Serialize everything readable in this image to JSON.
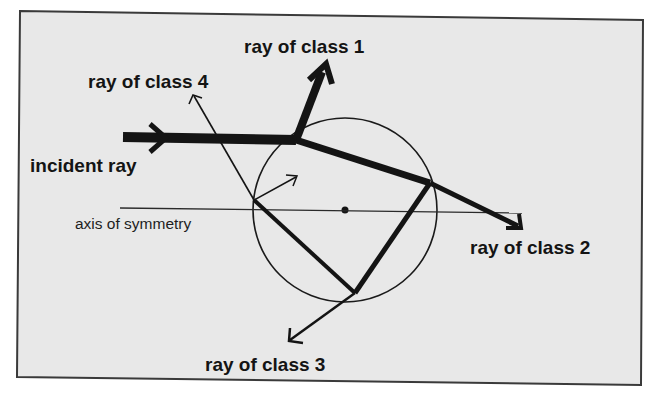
{
  "diagram": {
    "colors": {
      "background": "#e8e8e8",
      "frame": "#3a3a3a",
      "ink": "#141414"
    },
    "labels": {
      "class1": "ray of class 1",
      "class2": "ray of class 2",
      "class3": "ray of class 3",
      "class4": "ray of class 4",
      "incident": "incident ray",
      "axis": "axis of symmetry"
    },
    "geometry": {
      "circle": {
        "cx": 345,
        "cy": 210,
        "r": 92
      },
      "axis": {
        "x1": 120,
        "y1": 208,
        "x2": 522,
        "y2": 213
      },
      "points": {
        "A_entry": [
          296,
          140
        ],
        "B": [
          430,
          183
        ],
        "C": [
          355,
          293
        ],
        "D": [
          254,
          200
        ]
      }
    }
  }
}
